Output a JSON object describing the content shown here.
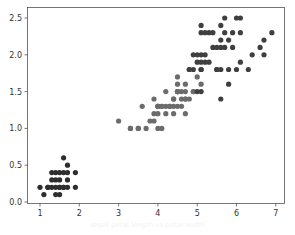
{
  "chart_data": {
    "type": "scatter",
    "title": "",
    "xlabel": "",
    "ylabel": "",
    "xlim": [
      0.7,
      7.2
    ],
    "ylim": [
      -0.02,
      2.62
    ],
    "x_ticks": [
      1,
      2,
      3,
      4,
      5,
      6,
      7
    ],
    "x_tick_labels": [
      "1",
      "2",
      "3",
      "4",
      "5",
      "6",
      "7"
    ],
    "y_ticks": [
      0.0,
      0.5,
      1.0,
      1.5,
      2.0,
      2.5
    ],
    "y_tick_labels": [
      "0.0",
      "0.5",
      "1.0",
      "1.5",
      "2.0",
      "2.5"
    ],
    "grid": false,
    "legend": null,
    "series": [
      {
        "name": "cluster-1",
        "color": "#2e2e2e",
        "points": [
          [
            1.4,
            0.2
          ],
          [
            1.3,
            0.2
          ],
          [
            1.5,
            0.2
          ],
          [
            1.7,
            0.4
          ],
          [
            1.4,
            0.3
          ],
          [
            1.5,
            0.1
          ],
          [
            1.6,
            0.2
          ],
          [
            1.1,
            0.1
          ],
          [
            1.2,
            0.2
          ],
          [
            1.3,
            0.4
          ],
          [
            1.7,
            0.3
          ],
          [
            1.0,
            0.2
          ],
          [
            1.7,
            0.5
          ],
          [
            1.9,
            0.2
          ],
          [
            1.6,
            0.4
          ],
          [
            1.4,
            0.1
          ],
          [
            1.5,
            0.4
          ],
          [
            1.6,
            0.6
          ],
          [
            1.3,
            0.3
          ],
          [
            1.9,
            0.4
          ],
          [
            1.5,
            0.3
          ],
          [
            1.7,
            0.2
          ],
          [
            1.4,
            0.4
          ],
          [
            1.2,
            0.2
          ],
          [
            1.6,
            0.2
          ],
          [
            1.5,
            0.2
          ]
        ]
      },
      {
        "name": "cluster-2",
        "color": "#6b6b6b",
        "points": [
          [
            4.7,
            1.4
          ],
          [
            4.5,
            1.5
          ],
          [
            4.9,
            1.5
          ],
          [
            4.0,
            1.3
          ],
          [
            4.6,
            1.5
          ],
          [
            4.5,
            1.3
          ],
          [
            4.7,
            1.6
          ],
          [
            3.3,
            1.0
          ],
          [
            4.6,
            1.3
          ],
          [
            3.9,
            1.4
          ],
          [
            3.5,
            1.0
          ],
          [
            4.2,
            1.5
          ],
          [
            4.0,
            1.0
          ],
          [
            4.7,
            1.4
          ],
          [
            3.6,
            1.3
          ],
          [
            4.4,
            1.4
          ],
          [
            4.5,
            1.5
          ],
          [
            4.1,
            1.0
          ],
          [
            4.5,
            1.5
          ],
          [
            3.9,
            1.1
          ],
          [
            4.8,
            1.8
          ],
          [
            4.0,
            1.3
          ],
          [
            4.9,
            1.5
          ],
          [
            4.7,
            1.2
          ],
          [
            4.3,
            1.3
          ],
          [
            4.4,
            1.4
          ],
          [
            4.8,
            1.4
          ],
          [
            5.0,
            1.7
          ],
          [
            4.5,
            1.5
          ],
          [
            3.5,
            1.0
          ],
          [
            3.8,
            1.1
          ],
          [
            3.7,
            1.0
          ],
          [
            3.9,
            1.2
          ],
          [
            5.1,
            1.6
          ],
          [
            4.5,
            1.6
          ],
          [
            4.7,
            1.5
          ],
          [
            4.4,
            1.3
          ],
          [
            4.1,
            1.3
          ],
          [
            4.0,
            1.3
          ],
          [
            4.4,
            1.2
          ],
          [
            4.6,
            1.4
          ],
          [
            4.0,
            1.2
          ],
          [
            3.3,
            1.0
          ],
          [
            4.2,
            1.3
          ],
          [
            4.2,
            1.2
          ],
          [
            4.3,
            1.3
          ],
          [
            3.0,
            1.1
          ],
          [
            4.1,
            1.3
          ],
          [
            4.5,
            1.7
          ]
        ]
      },
      {
        "name": "cluster-3",
        "color": "#3f3f3f",
        "points": [
          [
            6.0,
            2.5
          ],
          [
            5.1,
            1.9
          ],
          [
            5.9,
            2.1
          ],
          [
            5.6,
            1.8
          ],
          [
            5.8,
            2.2
          ],
          [
            6.6,
            2.1
          ],
          [
            6.3,
            1.8
          ],
          [
            5.8,
            1.8
          ],
          [
            6.1,
            2.5
          ],
          [
            5.1,
            2.0
          ],
          [
            5.3,
            1.9
          ],
          [
            5.5,
            2.1
          ],
          [
            5.0,
            2.0
          ],
          [
            5.1,
            2.4
          ],
          [
            5.3,
            2.3
          ],
          [
            5.5,
            1.8
          ],
          [
            6.7,
            2.2
          ],
          [
            6.9,
            2.3
          ],
          [
            5.0,
            1.5
          ],
          [
            5.7,
            2.3
          ],
          [
            4.9,
            2.0
          ],
          [
            6.7,
            2.0
          ],
          [
            4.9,
            1.8
          ],
          [
            5.7,
            2.1
          ],
          [
            6.0,
            1.8
          ],
          [
            4.8,
            1.8
          ],
          [
            5.8,
            1.6
          ],
          [
            6.1,
            1.9
          ],
          [
            6.4,
            2.0
          ],
          [
            5.6,
            2.2
          ],
          [
            5.1,
            1.5
          ],
          [
            5.6,
            1.4
          ],
          [
            6.1,
            2.3
          ],
          [
            5.6,
            2.4
          ],
          [
            5.5,
            1.8
          ],
          [
            5.4,
            2.1
          ],
          [
            5.1,
            2.3
          ],
          [
            5.9,
            2.3
          ],
          [
            5.7,
            2.5
          ],
          [
            5.2,
            2.3
          ],
          [
            5.2,
            2.0
          ],
          [
            5.4,
            2.3
          ],
          [
            5.1,
            1.8
          ],
          [
            5.0,
            1.9
          ],
          [
            5.6,
            2.1
          ],
          [
            5.2,
            1.9
          ],
          [
            5.1,
            1.8
          ]
        ]
      }
    ]
  },
  "caption": "sepal petal length vs petal width"
}
